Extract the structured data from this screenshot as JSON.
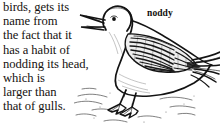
{
  "page": {
    "width": 220,
    "height": 132,
    "background_color": "#ffffff",
    "text_color": "#16120f"
  },
  "article": {
    "entry_word": "noddy",
    "body_lines": [
      "birds, gets its",
      "name from",
      "the fact that it",
      "has a habit of",
      "nodding its head,",
      "which is",
      "larger than",
      "that of gulls."
    ],
    "body_text": "birds, gets its name from the fact that it has a habit of nodding its head, which is larger than that of gulls."
  },
  "illustration": {
    "caption": "noddy",
    "subject": "noddy tern bird standing on sand",
    "style": "black ink line engraving with cross-hatching",
    "ink_color": "#1a1a1a",
    "parts": [
      "open-beak",
      "head",
      "eye",
      "neck",
      "breast",
      "hatched-wing",
      "forked-tail",
      "legs",
      "webbed-feet",
      "sandy-ground"
    ]
  }
}
